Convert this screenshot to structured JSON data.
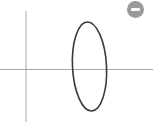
{
  "canvas": {
    "axis_color": "#a0a0a0",
    "curve_color": "#3a3a3a",
    "background": "#ffffff"
  },
  "shape": {
    "type": "ellipse",
    "cx": 89,
    "cy": 67,
    "rx": 17,
    "ry": 45
  },
  "controls": {
    "remove_button": {
      "icon": "minus-circle-icon",
      "color": "#9a9a9a"
    }
  }
}
